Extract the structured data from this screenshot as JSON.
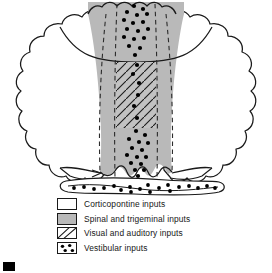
{
  "figure": {
    "colors": {
      "outline": "#1a1a1a",
      "white_fill": "#ffffff",
      "gray_fill": "#b9b9b9",
      "dot_color": "#000000",
      "hatch_color": "#1a1a1a",
      "background": "#ffffff"
    },
    "regions": [
      {
        "name": "left-hemisphere",
        "fill": "corticopontine",
        "side": "left"
      },
      {
        "name": "right-hemisphere",
        "fill": "corticopontine",
        "side": "right"
      },
      {
        "name": "paravermal-zone",
        "fill": "spinal-trigeminal",
        "side": "center"
      },
      {
        "name": "vermis-strip",
        "fill": "visual-auditory",
        "side": "center"
      },
      {
        "name": "vermis-top-dots",
        "fill": "vestibular",
        "side": "center-top"
      },
      {
        "name": "vermis-bottom-dots",
        "fill": "vestibular",
        "side": "center-bottom"
      },
      {
        "name": "flocculonodular-lobe",
        "fill": "vestibular",
        "side": "bottom"
      }
    ]
  },
  "legend": {
    "items": [
      {
        "key": "corticopontine",
        "pattern": "solid-white",
        "label": "Corticopontine inputs"
      },
      {
        "key": "spinal-trigeminal",
        "pattern": "solid-gray",
        "label": "Spinal and trigeminal inputs"
      },
      {
        "key": "visual-auditory",
        "pattern": "diagonal-hatch",
        "label": "Visual and auditory inputs"
      },
      {
        "key": "vestibular",
        "pattern": "dots",
        "label": "Vestibular inputs"
      }
    ]
  }
}
